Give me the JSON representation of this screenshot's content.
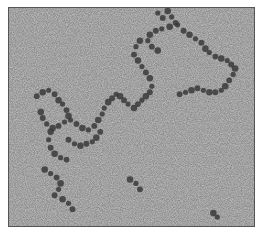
{
  "image": {
    "kind": "electron micrograph",
    "description": "Grayscale micrograph showing chains of dark globular particles (beads-on-a-string) on a grainy gray background",
    "background_color": "#8e8e8e",
    "particle_color": "#3a3a3a",
    "frame_border_color": "#555555"
  },
  "particles": [
    [
      158,
      12
    ],
    [
      163,
      17
    ],
    [
      168,
      10
    ],
    [
      172,
      16
    ],
    [
      176,
      22
    ],
    [
      170,
      26
    ],
    [
      162,
      28
    ],
    [
      156,
      30
    ],
    [
      150,
      34
    ],
    [
      148,
      40
    ],
    [
      152,
      46
    ],
    [
      158,
      50
    ],
    [
      178,
      24
    ],
    [
      184,
      30
    ],
    [
      190,
      34
    ],
    [
      196,
      38
    ],
    [
      202,
      42
    ],
    [
      206,
      48
    ],
    [
      210,
      52
    ],
    [
      216,
      56
    ],
    [
      222,
      58
    ],
    [
      228,
      60
    ],
    [
      232,
      64
    ],
    [
      236,
      68
    ],
    [
      234,
      74
    ],
    [
      230,
      80
    ],
    [
      226,
      86
    ],
    [
      222,
      90
    ],
    [
      216,
      92
    ],
    [
      210,
      92
    ],
    [
      204,
      90
    ],
    [
      198,
      88
    ],
    [
      192,
      90
    ],
    [
      186,
      92
    ],
    [
      180,
      94
    ],
    [
      140,
      40
    ],
    [
      136,
      46
    ],
    [
      134,
      54
    ],
    [
      138,
      60
    ],
    [
      142,
      66
    ],
    [
      146,
      72
    ],
    [
      150,
      78
    ],
    [
      152,
      86
    ],
    [
      150,
      92
    ],
    [
      146,
      96
    ],
    [
      142,
      100
    ],
    [
      138,
      104
    ],
    [
      134,
      108
    ],
    [
      128,
      104
    ],
    [
      124,
      100
    ],
    [
      120,
      96
    ],
    [
      116,
      94
    ],
    [
      112,
      98
    ],
    [
      108,
      102
    ],
    [
      104,
      108
    ],
    [
      36,
      96
    ],
    [
      42,
      92
    ],
    [
      48,
      90
    ],
    [
      54,
      94
    ],
    [
      58,
      100
    ],
    [
      62,
      104
    ],
    [
      66,
      110
    ],
    [
      68,
      116
    ],
    [
      64,
      122
    ],
    [
      58,
      126
    ],
    [
      52,
      128
    ],
    [
      46,
      124
    ],
    [
      42,
      118
    ],
    [
      40,
      112
    ],
    [
      70,
      120
    ],
    [
      76,
      124
    ],
    [
      82,
      128
    ],
    [
      88,
      130
    ],
    [
      94,
      126
    ],
    [
      98,
      120
    ],
    [
      102,
      114
    ],
    [
      100,
      132
    ],
    [
      96,
      138
    ],
    [
      92,
      142
    ],
    [
      86,
      144
    ],
    [
      80,
      146
    ],
    [
      74,
      144
    ],
    [
      68,
      140
    ],
    [
      50,
      132
    ],
    [
      48,
      140
    ],
    [
      50,
      148
    ],
    [
      54,
      154
    ],
    [
      60,
      158
    ],
    [
      66,
      160
    ],
    [
      44,
      170
    ],
    [
      50,
      174
    ],
    [
      56,
      178
    ],
    [
      60,
      184
    ],
    [
      58,
      190
    ],
    [
      54,
      196
    ],
    [
      62,
      200
    ],
    [
      68,
      204
    ],
    [
      72,
      210
    ],
    [
      130,
      180
    ],
    [
      136,
      184
    ],
    [
      140,
      190
    ],
    [
      214,
      214
    ],
    [
      218,
      218
    ]
  ]
}
